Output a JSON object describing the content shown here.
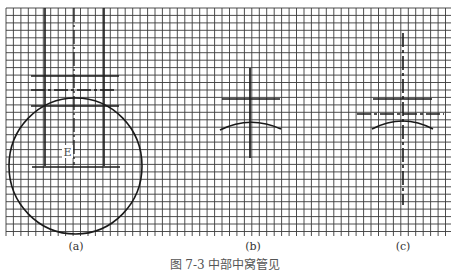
{
  "figure": {
    "caption": "图 7-3   中部中窝管见",
    "panels": [
      {
        "id": "a",
        "label": "(a)",
        "annotation": "E"
      },
      {
        "id": "b",
        "label": "(b)"
      },
      {
        "id": "c",
        "label": "(c)"
      }
    ]
  },
  "grid": {
    "spacing_px": 7.45,
    "line_color": "#2a2a2a",
    "background": "#ffffff"
  },
  "colors": {
    "stroke": "#1e1e1e"
  }
}
